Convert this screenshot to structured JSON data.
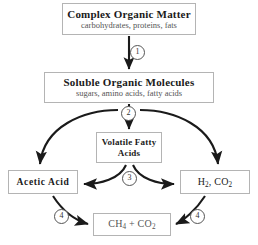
{
  "diagram": {
    "background_color": "#ffffff",
    "line_color": "#1a1a1a",
    "box_border_color": "#b4b4b4",
    "title_text_color": "#1a1a1a",
    "subtitle_text_color": "#555555"
  },
  "nodes": [
    {
      "id": "complex-organic-matter",
      "title": "Complex Organic Matter",
      "subtitle": "carbohydrates, proteins, fats"
    },
    {
      "id": "soluble-organic-molecules",
      "title": "Soluble Organic Molecules",
      "subtitle": "sugars, amino acids, fatty acids"
    },
    {
      "id": "volatile-fatty-acids",
      "title": "Volatile Fatty Acids",
      "subtitle": ""
    },
    {
      "id": "acetic-acid",
      "title": "Acetic Acid",
      "subtitle": ""
    },
    {
      "id": "h2-co2",
      "title": "H2, CO2",
      "subtitle": ""
    },
    {
      "id": "ch4-co2",
      "title": "CH4 + CO2",
      "subtitle": ""
    }
  ],
  "steps": [
    {
      "id": "1",
      "label": "1",
      "on_edge": "complex-organic-matter-to-soluble-organic-molecules"
    },
    {
      "id": "2",
      "label": "2",
      "on_edge": "soluble-organic-molecules-fanout"
    },
    {
      "id": "3",
      "label": "3",
      "on_edge": "volatile-fatty-acids-fanout"
    },
    {
      "id": "4a",
      "label": "4",
      "on_edge": "acetic-acid-to-ch4-co2"
    },
    {
      "id": "4b",
      "label": "4",
      "on_edge": "h2-co2-to-ch4-co2"
    }
  ],
  "edges": [
    {
      "from": "complex-organic-matter",
      "to": "soluble-organic-molecules",
      "style": "straight",
      "step": "1"
    },
    {
      "from": "soluble-organic-molecules",
      "to": "volatile-fatty-acids",
      "style": "straight",
      "step": "2"
    },
    {
      "from": "soluble-organic-molecules",
      "to": "acetic-acid",
      "style": "curved",
      "step": "2"
    },
    {
      "from": "soluble-organic-molecules",
      "to": "h2-co2",
      "style": "curved",
      "step": "2"
    },
    {
      "from": "volatile-fatty-acids",
      "to": "acetic-acid",
      "style": "curved",
      "step": "3"
    },
    {
      "from": "volatile-fatty-acids",
      "to": "h2-co2",
      "style": "curved",
      "step": "3"
    },
    {
      "from": "acetic-acid",
      "to": "ch4-co2",
      "style": "curved",
      "step": "4"
    },
    {
      "from": "h2-co2",
      "to": "ch4-co2",
      "style": "curved",
      "step": "4"
    }
  ]
}
